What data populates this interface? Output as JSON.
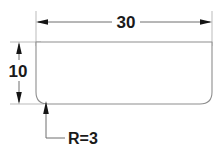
{
  "drawing": {
    "title": "Rounded bottom profile dimension drawing",
    "background_color": "#ffffff",
    "outline_color": "#8e8e8e",
    "dimension_color": "#6e6e6e",
    "text_color": "#1a1a1a",
    "extension_color": "#b3b3b3",
    "dimensions": {
      "width": {
        "label": "30",
        "name": "width-dimension",
        "orientation": "horizontal",
        "position": "top"
      },
      "height": {
        "label": "10",
        "name": "height-dimension",
        "orientation": "vertical",
        "position": "left"
      },
      "radius": {
        "label": "R=3",
        "name": "radius-callout",
        "orientation": "leader",
        "position": "bottom-left"
      }
    },
    "shape": {
      "name": "rounded-rectangle-profile",
      "corner_radius": 3,
      "width_value": 30,
      "height_value": 10
    }
  }
}
